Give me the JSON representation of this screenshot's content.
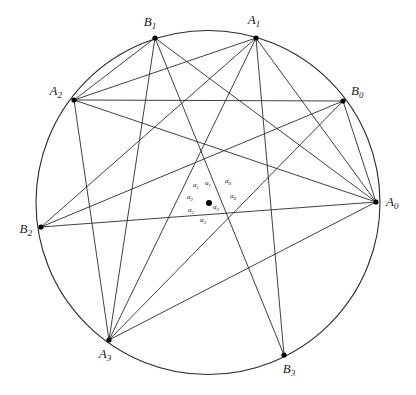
{
  "figure": {
    "background_color": "#ffffff",
    "stroke_color": "#2b2b2b",
    "circle": {
      "cx": 208,
      "cy": 202.5,
      "r": 172
    },
    "center_point": {
      "x": 209,
      "y": 203
    },
    "vertices": [
      {
        "id": "A0",
        "base": "A",
        "sub": "0",
        "x": 376,
        "y": 202,
        "lx": 386,
        "ly": 206,
        "anchor": "start"
      },
      {
        "id": "A1",
        "base": "A",
        "sub": "1",
        "x": 256,
        "y": 38,
        "lx": 254,
        "ly": 24,
        "anchor": "middle"
      },
      {
        "id": "A2",
        "base": "A",
        "sub": "2",
        "x": 74,
        "y": 100,
        "lx": 62,
        "ly": 95,
        "anchor": "end"
      },
      {
        "id": "A3",
        "base": "A",
        "sub": "3",
        "x": 109,
        "y": 340,
        "lx": 105,
        "ly": 358,
        "anchor": "middle"
      },
      {
        "id": "B0",
        "base": "B",
        "sub": "0",
        "x": 343,
        "y": 101,
        "lx": 351,
        "ly": 95,
        "anchor": "start"
      },
      {
        "id": "B1",
        "base": "B",
        "sub": "1",
        "x": 155,
        "y": 38,
        "lx": 150,
        "ly": 26,
        "anchor": "middle"
      },
      {
        "id": "B2",
        "base": "B",
        "sub": "2",
        "x": 41,
        "y": 227,
        "lx": 32,
        "ly": 233,
        "anchor": "end"
      },
      {
        "id": "B3",
        "base": "B",
        "sub": "3",
        "x": 284,
        "y": 355,
        "lx": 289,
        "ly": 373,
        "anchor": "middle"
      }
    ],
    "chords": [
      {
        "name": "A0-A1",
        "from": "A0",
        "to": "A1"
      },
      {
        "name": "A0-A2",
        "from": "A0",
        "to": "A2"
      },
      {
        "name": "A0-A3",
        "from": "A0",
        "to": "A3"
      },
      {
        "name": "A0-B0",
        "from": "A0",
        "to": "B0"
      },
      {
        "name": "A0-B1",
        "from": "A0",
        "to": "B1"
      },
      {
        "name": "A0-B2",
        "from": "A0",
        "to": "B2"
      },
      {
        "name": "A1-A2",
        "from": "A1",
        "to": "A2"
      },
      {
        "name": "A1-A3",
        "from": "A1",
        "to": "A3"
      },
      {
        "name": "A1-B2",
        "from": "A1",
        "to": "B2"
      },
      {
        "name": "A1-B3",
        "from": "A1",
        "to": "B3"
      },
      {
        "name": "A2-A3",
        "from": "A2",
        "to": "A3"
      },
      {
        "name": "A2-B0",
        "from": "A2",
        "to": "B0"
      },
      {
        "name": "A2-B1",
        "from": "A2",
        "to": "B1"
      },
      {
        "name": "A3-B0",
        "from": "A3",
        "to": "B0"
      },
      {
        "name": "A3-B1",
        "from": "A3",
        "to": "B1"
      },
      {
        "name": "B1-B3",
        "from": "B1",
        "to": "B3"
      },
      {
        "name": "B2-B0",
        "from": "B2",
        "to": "B0"
      }
    ],
    "angle_labels": [
      {
        "id": "alpha0-upper",
        "base": "α",
        "sub": "0",
        "x": 228,
        "y": 183
      },
      {
        "id": "alpha0-lower",
        "base": "α",
        "sub": "0",
        "x": 233,
        "y": 198
      },
      {
        "id": "alpha1-left",
        "base": "α",
        "sub": "1",
        "x": 196,
        "y": 187
      },
      {
        "id": "alpha1-right",
        "base": "α",
        "sub": "1",
        "x": 208,
        "y": 185
      },
      {
        "id": "alpha2-upper",
        "base": "α",
        "sub": "2",
        "x": 190,
        "y": 199
      },
      {
        "id": "alpha2-lower",
        "base": "α",
        "sub": "2",
        "x": 191,
        "y": 212
      },
      {
        "id": "alpha3-right",
        "base": "α",
        "sub": "3",
        "x": 216,
        "y": 209
      },
      {
        "id": "alpha3-lower",
        "base": "α",
        "sub": "3",
        "x": 203,
        "y": 222
      }
    ]
  }
}
